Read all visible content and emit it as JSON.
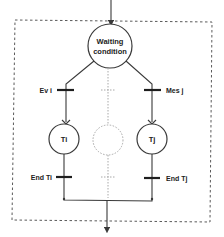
{
  "diagram": {
    "type": "petri-net",
    "places": {
      "waiting": {
        "line1": "Waiting",
        "line2": "condition"
      },
      "left_task": "Ti",
      "right_task": "Tj",
      "ghost_task": ""
    },
    "transitions": {
      "left_start": "Ev i",
      "right_start": "Mes j",
      "left_end": "End Ti",
      "right_end": "End Tj"
    },
    "colors": {
      "line": "#3a3a3a",
      "ghost": "#a8a8a8",
      "frame": "#5a5a5a"
    }
  }
}
